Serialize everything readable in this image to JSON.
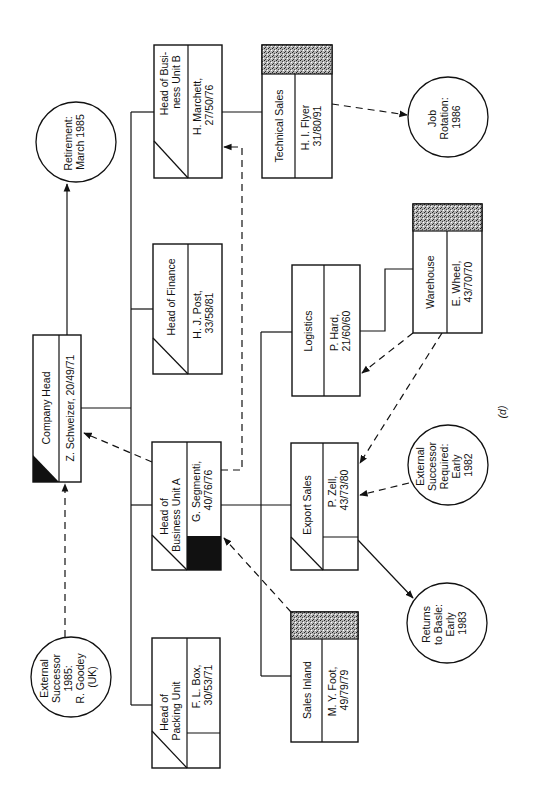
{
  "figure": {
    "label": "(d)",
    "orientation": "rotated 90 degrees counter-clockwise"
  },
  "positions": {
    "company_head": {
      "title": "Company Head",
      "person": "Z. Schweizer, 20/49/71"
    },
    "head_bu_b": {
      "title_line1": "Head of Busi-",
      "title_line2": "ness Unit B",
      "person_line1": "H. Marchett,",
      "person_line2": "27/50/76"
    },
    "head_finance": {
      "title": "Head of Finance",
      "person_line1": "H. J. Post,",
      "person_line2": "33/58/81"
    },
    "head_bu_a": {
      "title_line1": "Head of",
      "title_line2": "Business Unit A",
      "person_line1": "G. Segmenti,",
      "person_line2": "40/76/76"
    },
    "head_packing": {
      "title_line1": "Head of",
      "title_line2": "Packing Unit",
      "person_line1": "F. L. Box,",
      "person_line2": "30/53/71"
    },
    "technical_sales": {
      "title": "Technical Sales",
      "person_line1": "H. I. Flyer",
      "person_line2": "31/80/91"
    },
    "logistics": {
      "title": "Logistics",
      "person_line1": "P. Hard,",
      "person_line2": "21/60/60"
    },
    "warehouse": {
      "title": "Warehouse",
      "person_line1": "E. Wheel,",
      "person_line2": "43/70/70"
    },
    "export_sales": {
      "title": "Export Sales",
      "person_line1": "P. Zell,",
      "person_line2": "43/73/80"
    },
    "sales_inland": {
      "title": "Sales Inland",
      "person_line1": "M. Y. Foot,",
      "person_line2": "49/79/79"
    }
  },
  "notes": {
    "retirement": {
      "line1": "Retirement:",
      "line2": "March 1985"
    },
    "job_rotation": {
      "line1": "Job",
      "line2": "Rotation:",
      "line3": "1986"
    },
    "external_successor_required": {
      "line1": "External",
      "line2": "Successor",
      "line3": "Required:",
      "line4": "Early",
      "line5": "1982"
    },
    "returns_to_basle": {
      "line1": "Returns",
      "line2": "to Basle:",
      "line3": "Early",
      "line4": "1983"
    },
    "external_successor_1985": {
      "line1": "External",
      "line2": "Successor",
      "line3": "1985:",
      "line4": "R. Goodey",
      "line5": "(UK)"
    }
  },
  "colors": {
    "ink": "#111111",
    "background": "#ffffff",
    "stipple": "#8a8a8a"
  }
}
